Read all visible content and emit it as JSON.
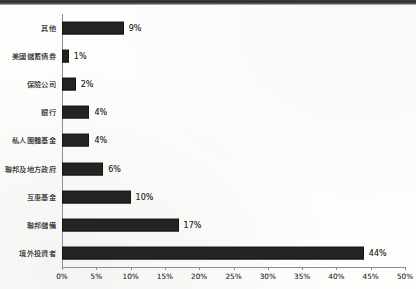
{
  "chart_data": {
    "type": "bar",
    "orientation": "horizontal",
    "title": "",
    "xlabel": "",
    "ylabel": "",
    "categories": [
      "其他",
      "美國儲蓄債券",
      "保險公司",
      "銀行",
      "私人團體基金",
      "聯邦及地方政府",
      "互惠基金",
      "聯邦儲備",
      "境外投資者"
    ],
    "values": [
      9,
      1,
      2,
      4,
      4,
      6,
      10,
      17,
      44
    ],
    "value_labels": [
      "9%",
      "1%",
      "2%",
      "4%",
      "4%",
      "6%",
      "10%",
      "17%",
      "44%"
    ],
    "xlim": [
      0,
      50
    ],
    "xtick_values": [
      0,
      5,
      10,
      15,
      20,
      25,
      30,
      35,
      40,
      45,
      50
    ],
    "xtick_labels": [
      "0%",
      "5%",
      "10%",
      "15%",
      "20%",
      "25%",
      "30%",
      "35%",
      "40%",
      "45%",
      "50%"
    ],
    "grid": false,
    "legend": null,
    "bar_color": "#232323",
    "axis_color": "#8d8d8a",
    "background_color": "#fdfdfc"
  }
}
